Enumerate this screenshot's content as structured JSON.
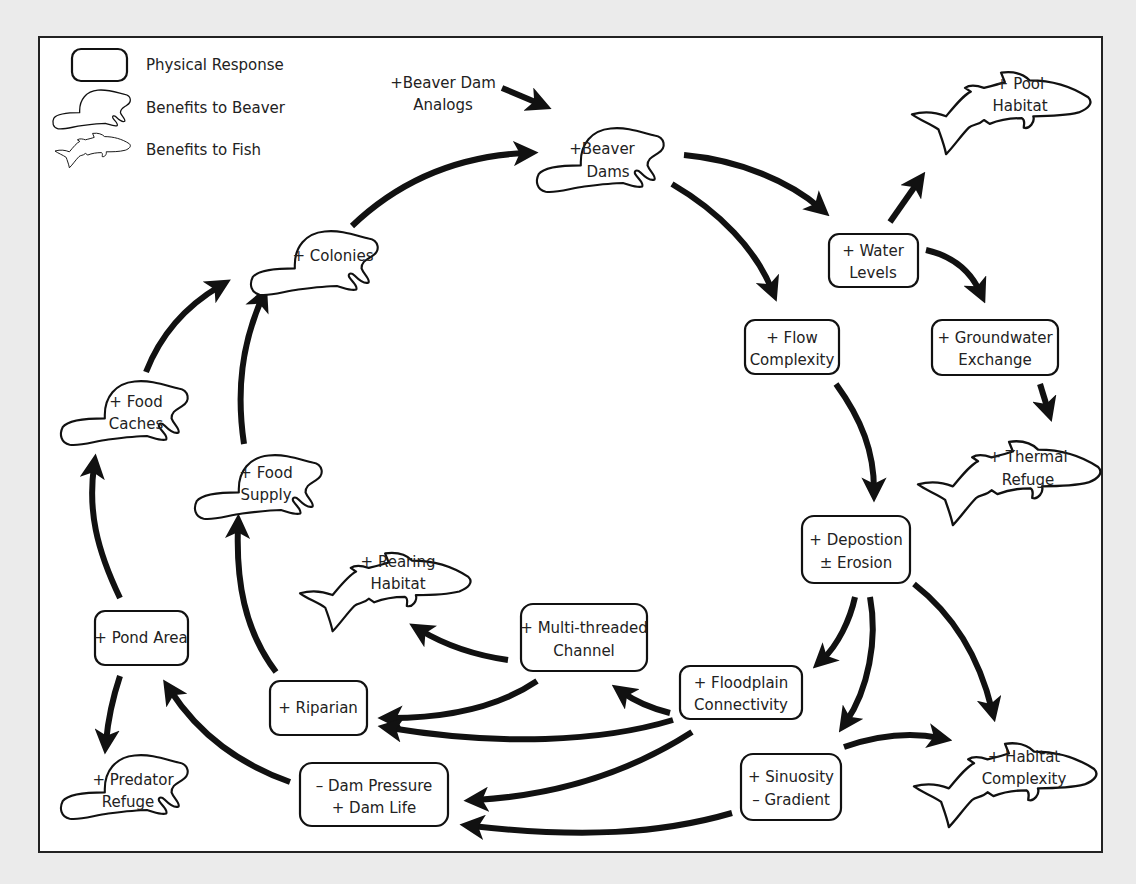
{
  "diagram": {
    "colors": {
      "background": "#ebebeb",
      "panel": "#ffffff",
      "ink": "#111111"
    },
    "legend": [
      {
        "shape": "rounded-box",
        "label": "Physical Response"
      },
      {
        "shape": "beaver",
        "label": "Benefits to Beaver"
      },
      {
        "shape": "fish",
        "label": "Benefits to Fish"
      }
    ],
    "input": {
      "line1": "+Beaver Dam",
      "line2": "Analogs"
    },
    "beaver_nodes": {
      "beaver_dams": {
        "line1": "+Beaver",
        "line2": "Dams"
      },
      "colonies": {
        "line1": "+ Colonies",
        "line2": ""
      },
      "food_caches": {
        "line1": "+ Food",
        "line2": "Caches"
      },
      "food_supply": {
        "line1": "+ Food",
        "line2": "Supply"
      },
      "predator_refuge": {
        "line1": "+ Predator",
        "line2": "Refuge"
      }
    },
    "fish_nodes": {
      "pool_habitat": {
        "line1": "+ Pool",
        "line2": "Habitat"
      },
      "thermal_refuge": {
        "line1": "+ Thermal",
        "line2": "Refuge"
      },
      "rearing_habitat": {
        "line1": "+ Rearing",
        "line2": "Habitat"
      },
      "habitat_complexity": {
        "line1": "+ Habitat",
        "line2": "Complexity"
      }
    },
    "physical_nodes": {
      "water_levels": {
        "line1": "+ Water",
        "line2": "Levels"
      },
      "flow_complexity": {
        "line1": "+ Flow",
        "line2": "Complexity"
      },
      "groundwater_exchange": {
        "line1": "+ Groundwater",
        "line2": "Exchange"
      },
      "deposition_erosion": {
        "line1": "+ Depostion",
        "line2": "± Erosion"
      },
      "multi_threaded_channel": {
        "line1": "+ Multi-threaded",
        "line2": "Channel"
      },
      "floodplain_connectivity": {
        "line1": "+ Floodplain",
        "line2": "Connectivity"
      },
      "sinuosity_gradient": {
        "line1": "+ Sinuosity",
        "line2": "– Gradient"
      },
      "pond_area": {
        "line1": "+ Pond Area",
        "line2": ""
      },
      "riparian": {
        "line1": "+ Riparian",
        "line2": ""
      },
      "dam_pressure_life": {
        "line1": "– Dam Pressure",
        "line2": "+ Dam Life"
      }
    },
    "edges": [
      [
        "beaver_dam_analogs",
        "beaver_dams"
      ],
      [
        "colonies",
        "beaver_dams"
      ],
      [
        "beaver_dams",
        "water_levels"
      ],
      [
        "beaver_dams",
        "flow_complexity"
      ],
      [
        "water_levels",
        "pool_habitat"
      ],
      [
        "water_levels",
        "groundwater_exchange"
      ],
      [
        "groundwater_exchange",
        "thermal_refuge"
      ],
      [
        "flow_complexity",
        "deposition_erosion"
      ],
      [
        "deposition_erosion",
        "floodplain_connectivity"
      ],
      [
        "deposition_erosion",
        "sinuosity_gradient"
      ],
      [
        "deposition_erosion",
        "habitat_complexity"
      ],
      [
        "sinuosity_gradient",
        "habitat_complexity"
      ],
      [
        "floodplain_connectivity",
        "multi_threaded_channel"
      ],
      [
        "floodplain_connectivity",
        "riparian"
      ],
      [
        "floodplain_connectivity",
        "dam_pressure_life"
      ],
      [
        "multi_threaded_channel",
        "rearing_habitat"
      ],
      [
        "multi_threaded_channel",
        "riparian"
      ],
      [
        "sinuosity_gradient",
        "dam_pressure_life"
      ],
      [
        "dam_pressure_life",
        "pond_area"
      ],
      [
        "riparian",
        "food_supply"
      ],
      [
        "food_supply",
        "colonies"
      ],
      [
        "pond_area",
        "food_caches"
      ],
      [
        "pond_area",
        "predator_refuge"
      ],
      [
        "food_caches",
        "colonies"
      ]
    ]
  }
}
